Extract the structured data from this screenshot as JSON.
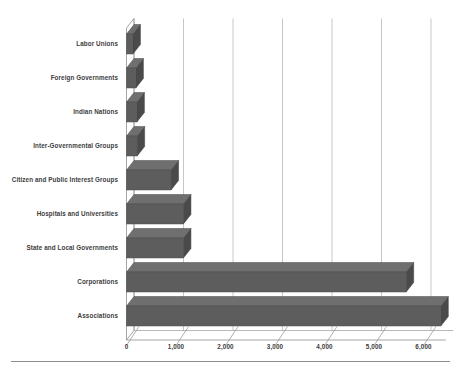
{
  "chart_data": {
    "type": "bar",
    "orientation": "horizontal",
    "style": "3d",
    "title": "",
    "subtitle": "",
    "xlabel": "",
    "ylabel": "",
    "xlim": [
      0,
      6500
    ],
    "ylim": null,
    "grid": true,
    "grid_axis": "x",
    "legend": null,
    "legend_position": "none",
    "categories": [
      "Labor Unions",
      "Foreign Governments",
      "Indian Nations",
      "Inter-Governmental Groups",
      "Citizen and Public Interest Groups",
      "Hospitals and Universities",
      "State and Local Governments",
      "Corporations",
      "Associations"
    ],
    "values": [
      130,
      190,
      210,
      215,
      900,
      1150,
      1150,
      5650,
      6350
    ],
    "xticks": [
      0,
      1000,
      2000,
      3000,
      4000,
      5000,
      6000
    ],
    "xtick_labels": [
      "0",
      "1,000",
      "2,000",
      "3,000",
      "4,000",
      "5,000",
      "6,000"
    ],
    "bar_color": "#5d5d5d",
    "bar_top_color": "#6f6f6f",
    "bar_side_color": "#4a4a4a",
    "grid_color": "#b9b9b9",
    "axis_color": "#9a9a9a",
    "text_color": "#3d3d3d",
    "background_color": "#ffffff"
  },
  "figure": {
    "rule_color": "#8d8d8d"
  }
}
